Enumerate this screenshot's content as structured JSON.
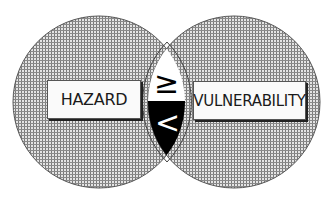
{
  "diagram": {
    "left_circle": {
      "label": "HAZARD",
      "cx": 99,
      "cy": 102,
      "r": 86
    },
    "right_circle": {
      "label": "VULNERABILITY",
      "cx": 234,
      "cy": 102,
      "r": 86
    },
    "intersection": {
      "upper_symbol": "≥",
      "lower_symbol": "<",
      "upper_fill": "#ffffff",
      "lower_fill": "#000000"
    },
    "colors": {
      "hatch_line": "#6e6e6e",
      "hatch_bg": "#e4e4e4",
      "label_bg": "#fafafa",
      "outline": "#444444"
    }
  }
}
